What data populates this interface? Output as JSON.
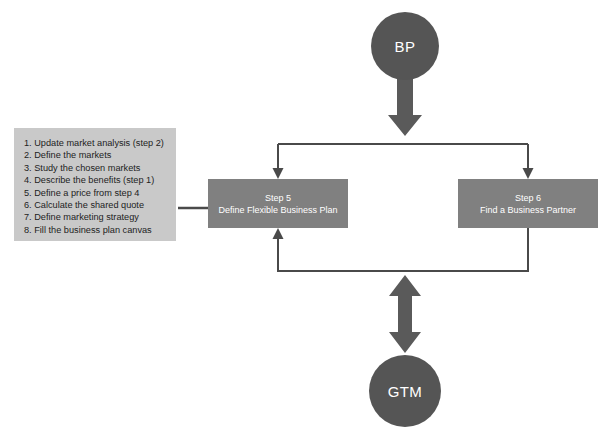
{
  "diagram": {
    "type": "flowchart",
    "title_nodes": {
      "top_circle": {
        "label": "BP",
        "shape": "circle",
        "fill": "#555555",
        "text_color": "#ffffff"
      },
      "bottom_circle": {
        "label": "GTM",
        "shape": "circle",
        "fill": "#555555",
        "text_color": "#ffffff"
      }
    },
    "process_boxes": [
      {
        "id": "step-5",
        "title": "Step 5",
        "subtitle": "Define Flexible Business Plan",
        "fill": "#808080",
        "text_color": "#ffffff"
      },
      {
        "id": "step-6",
        "title": "Step 6",
        "subtitle": "Find a Business Partner",
        "fill": "#808080",
        "text_color": "#ffffff"
      }
    ],
    "checklist": {
      "fill": "#c9c9c9",
      "text_color": "#1d1d1d",
      "items": [
        "1. Update market analysis (step 2)",
        "2. Define the markets",
        "3. Study the chosen markets",
        "4. Describe the benefits (step 1)",
        "5. Define a price from step 4",
        "6. Calculate the shared quote",
        "7. Define marketing strategy",
        "8. Fill the business plan canvas"
      ]
    },
    "connectors": [
      {
        "name": "bp-to-split",
        "style": "thick-block-arrow",
        "direction": "down",
        "color": "#5a5a5a"
      },
      {
        "name": "split-bar",
        "style": "line",
        "direction": "horizontal",
        "color": "#4a4a4a"
      },
      {
        "name": "split-to-step-5",
        "style": "thin-arrow",
        "direction": "down",
        "color": "#4a4a4a"
      },
      {
        "name": "split-to-step-6",
        "style": "thin-arrow",
        "direction": "down",
        "color": "#4a4a4a"
      },
      {
        "name": "step-6-to-step-5-feedback",
        "style": "thin-arrow",
        "direction": "loop-left-up",
        "color": "#4a4a4a"
      },
      {
        "name": "checklist-to-step-5",
        "style": "line",
        "direction": "horizontal",
        "color": "#4a4a4a"
      },
      {
        "name": "gtm-double-arrow",
        "style": "thick-block-arrow",
        "direction": "up-down",
        "color": "#5a5a5a"
      }
    ],
    "palette": {
      "background": "#ffffff",
      "circle_fill": "#555555",
      "box_fill": "#808080",
      "checklist_fill": "#c9c9c9",
      "connector": "#4a4a4a",
      "thick_arrow": "#5a5a5a"
    }
  }
}
